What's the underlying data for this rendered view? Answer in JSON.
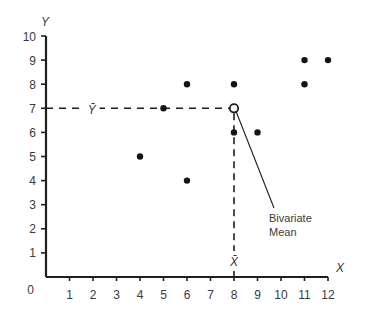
{
  "chart_data": {
    "type": "scatter",
    "title": "",
    "xlabel": "X",
    "ylabel": "Y",
    "xlim": [
      0,
      12
    ],
    "ylim": [
      0,
      10
    ],
    "grid": false,
    "x_ticks": [
      1,
      2,
      3,
      4,
      5,
      6,
      7,
      8,
      9,
      10,
      11,
      12
    ],
    "y_ticks": [
      1,
      2,
      3,
      4,
      5,
      6,
      7,
      8,
      9,
      10
    ],
    "origin_label": "0",
    "series": [
      {
        "name": "observations",
        "points": [
          {
            "x": 4,
            "y": 5
          },
          {
            "x": 5,
            "y": 7
          },
          {
            "x": 6,
            "y": 8
          },
          {
            "x": 6,
            "y": 4
          },
          {
            "x": 8,
            "y": 8
          },
          {
            "x": 8,
            "y": 6
          },
          {
            "x": 9,
            "y": 6
          },
          {
            "x": 11,
            "y": 9
          },
          {
            "x": 11,
            "y": 8
          },
          {
            "x": 12,
            "y": 9
          }
        ]
      }
    ],
    "bivariate_mean": {
      "x": 8,
      "y": 7
    },
    "reference_lines": [
      {
        "orientation": "horizontal",
        "value": 7,
        "label": "Ȳ",
        "style": "dashed"
      },
      {
        "orientation": "vertical",
        "value": 8,
        "label": "X̄",
        "style": "dashed"
      }
    ],
    "annotations": [
      {
        "text_lines": [
          "Bivariate",
          "Mean"
        ],
        "points_to": {
          "x": 8,
          "y": 7
        }
      }
    ]
  }
}
